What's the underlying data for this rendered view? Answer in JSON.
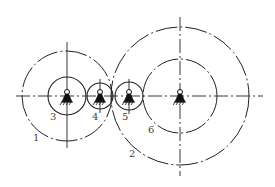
{
  "diagram": {
    "type": "gear-train-schematic",
    "axis_y": 96,
    "gears": [
      {
        "id": "1",
        "role": "outer pitch circle",
        "cx": 67,
        "cy": 96,
        "r": 45,
        "style": "dash-dot"
      },
      {
        "id": "3",
        "role": "gear",
        "cx": 67,
        "cy": 96,
        "r": 19,
        "style": "solid"
      },
      {
        "id": "4",
        "role": "idler gear",
        "cx": 100,
        "cy": 96,
        "r": 13,
        "style": "solid"
      },
      {
        "id": "5",
        "role": "idler gear",
        "cx": 129,
        "cy": 96,
        "r": 14,
        "style": "solid"
      },
      {
        "id": "6",
        "role": "gear",
        "cx": 180,
        "cy": 96,
        "r": 37,
        "style": "dash-dot"
      },
      {
        "id": "2",
        "role": "outer pitch circle",
        "cx": 180,
        "cy": 96,
        "r": 69,
        "style": "dash-dot"
      }
    ],
    "labels": [
      {
        "text": "1",
        "x": 33,
        "y": 141
      },
      {
        "text": "3",
        "x": 50,
        "y": 120
      },
      {
        "text": "4",
        "x": 92,
        "y": 120
      },
      {
        "text": "5",
        "x": 122,
        "y": 120
      },
      {
        "text": "6",
        "x": 148,
        "y": 133
      },
      {
        "text": "2",
        "x": 129,
        "y": 157
      }
    ],
    "line_color": "#222222",
    "label_color": "#444444"
  }
}
